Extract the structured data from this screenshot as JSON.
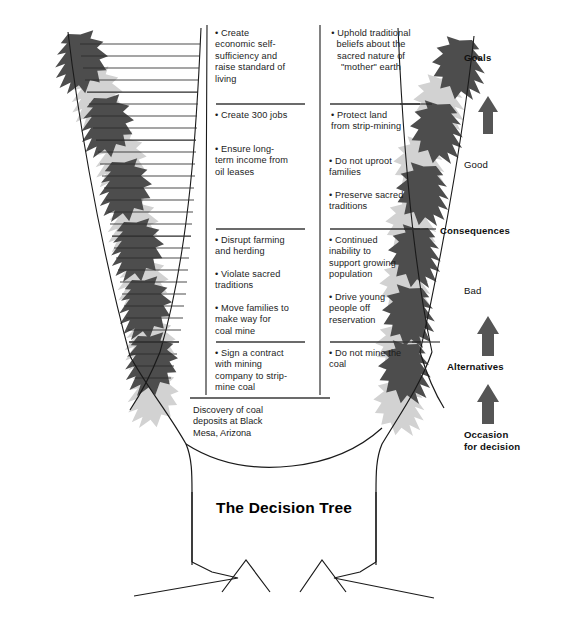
{
  "diagram": {
    "title": "The Decision\nTree",
    "occasion_text": "Discovery of coal deposits at Black Mesa, Arizona",
    "colors": {
      "leaf_dark": "#4d4d4d",
      "leaf_light": "#d2d2d2",
      "outline": "#1a1a1a",
      "arrow": "#555555",
      "text": "#1c1c1c"
    }
  },
  "left_branch": {
    "name": "left-alternative-branch",
    "items": [
      {
        "id": "goal-1",
        "text": "• Create economic self-sufficiency and raise standard of living",
        "group": "goals"
      },
      {
        "id": "goal-2",
        "text": "• Create 300 jobs",
        "group": "goals"
      },
      {
        "id": "goal-3",
        "text": "• Ensure long-term income from oil leases",
        "group": "goals"
      },
      {
        "id": "cons-1",
        "text": "• Disrupt farming and herding",
        "group": "consequences"
      },
      {
        "id": "cons-2",
        "text": "• Violate sacred traditions",
        "group": "consequences"
      },
      {
        "id": "cons-3",
        "text": "• Move families to make way for coal mine",
        "group": "consequences"
      },
      {
        "id": "alt-1",
        "text": "• Sign a contract with mining company to strip-mine coal",
        "group": "alternatives"
      }
    ]
  },
  "right_branch": {
    "name": "right-alternative-branch",
    "items": [
      {
        "id": "rgoal-1",
        "text": "• Uphold traditional beliefs about the sacred nature of \"mother\" earth",
        "group": "goals"
      },
      {
        "id": "rgoal-2",
        "text": "• Protect land from strip-mining",
        "group": "goals"
      },
      {
        "id": "rgoal-3",
        "text": "• Do not uproot families",
        "group": "goals"
      },
      {
        "id": "rgoal-4",
        "text": "• Preserve sacred traditions",
        "group": "goals"
      },
      {
        "id": "rcons-1",
        "text": "• Continued inability to support growing population",
        "group": "consequences"
      },
      {
        "id": "rcons-2",
        "text": "• Drive young people off reservation",
        "group": "consequences"
      },
      {
        "id": "ralt-1",
        "text": "• Do not mine the coal",
        "group": "alternatives"
      }
    ]
  },
  "legend": {
    "name": "vertical-legend",
    "items": [
      {
        "id": "legend-goals",
        "label": "Goals",
        "bold": true
      },
      {
        "id": "legend-good",
        "label": "Good",
        "bold": false
      },
      {
        "id": "legend-consequences",
        "label": "Consequences",
        "bold": true
      },
      {
        "id": "legend-bad",
        "label": "Bad",
        "bold": false
      },
      {
        "id": "legend-alternatives",
        "label": "Alternatives",
        "bold": true
      },
      {
        "id": "legend-occasion",
        "label": "Occasion\nfor decision",
        "bold": true
      }
    ]
  }
}
